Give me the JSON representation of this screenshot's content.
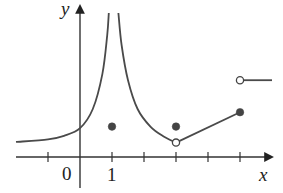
{
  "chart_data": {
    "type": "line",
    "title": "",
    "xlabel": "x",
    "ylabel": "y",
    "tick_labels": {
      "origin": "0",
      "x_one": "1"
    },
    "x_ticks": [
      -1,
      0,
      1,
      2,
      3,
      4,
      5
    ],
    "xlim": [
      -2,
      6
    ],
    "ylim": [
      -1,
      4.5
    ],
    "grid": false,
    "vertical_asymptote": 1,
    "series": [
      {
        "name": "left-branch",
        "description": "curve approaching horizontal asymptote ~0.5 on the left, rising to vertical asymptote at x=1",
        "points": [
          [
            -2,
            0.47
          ],
          [
            -1,
            0.55
          ],
          [
            -0.5,
            0.66
          ],
          [
            0,
            0.9
          ],
          [
            0.4,
            1.5
          ],
          [
            0.7,
            2.6
          ],
          [
            0.85,
            3.8
          ],
          [
            0.9,
            4.5
          ]
        ]
      },
      {
        "name": "right-branch",
        "description": "curve from vertical asymptote at x=1 descending to open point at (3, 0.5)",
        "points": [
          [
            1.2,
            4.5
          ],
          [
            1.3,
            3.5
          ],
          [
            1.5,
            2.4
          ],
          [
            1.8,
            1.5
          ],
          [
            2.2,
            0.95
          ],
          [
            2.6,
            0.65
          ],
          [
            3,
            0.45
          ]
        ]
      },
      {
        "name": "segment",
        "points": [
          [
            3,
            0.45
          ],
          [
            5,
            1.4
          ]
        ]
      },
      {
        "name": "right-ray",
        "points": [
          [
            5,
            2.4
          ],
          [
            6,
            2.4
          ]
        ]
      }
    ],
    "special_points": [
      {
        "x": 1,
        "y": 0.95,
        "style": "filled"
      },
      {
        "x": 3,
        "y": 0.95,
        "style": "filled"
      },
      {
        "x": 3,
        "y": 0.45,
        "style": "open"
      },
      {
        "x": 5,
        "y": 1.4,
        "style": "filled"
      },
      {
        "x": 5,
        "y": 2.4,
        "style": "open"
      }
    ],
    "colors": {
      "curve": "#4a4a4a",
      "axis": "#333333",
      "dot": "#444444"
    }
  }
}
